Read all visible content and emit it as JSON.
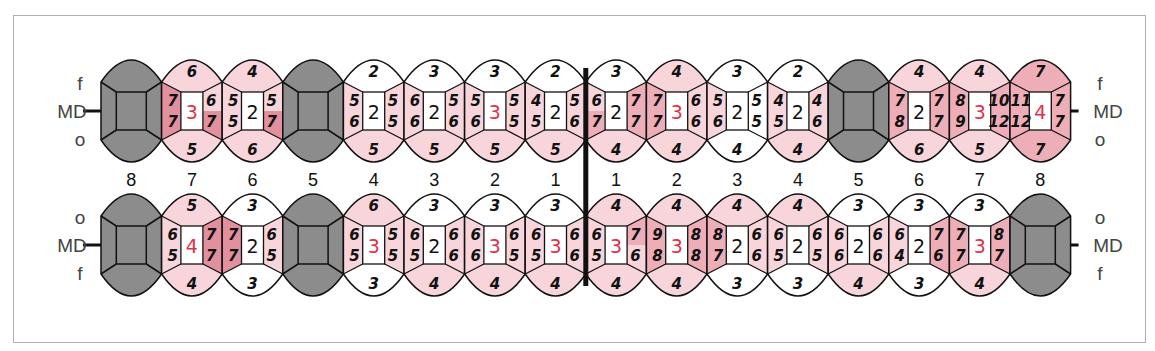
{
  "chart": {
    "row_labels": {
      "upper": {
        "top": "f",
        "middle": "MD",
        "bottom": "o"
      },
      "lower": {
        "top": "o",
        "middle": "MD",
        "bottom": "f"
      }
    },
    "tooth_numbers": [
      "8",
      "7",
      "6",
      "5",
      "4",
      "3",
      "2",
      "1",
      "1",
      "2",
      "3",
      "4",
      "5",
      "6",
      "7",
      "8"
    ],
    "colors": {
      "missing": "#8c8c8c",
      "light": "#f7d5da",
      "medium": "#eeaeb8",
      "dark": "#e3909e",
      "white": "#ffffff",
      "red_text": "#e0304a"
    },
    "upper": [
      {
        "num": "8",
        "missing": true
      },
      {
        "num": "7",
        "top": "6",
        "bottom": "5",
        "lt": "7",
        "lb": "7",
        "rt": "6",
        "rb": "7",
        "center": "3",
        "red": true,
        "c": {
          "top": "light",
          "bottom": "light",
          "lt": "dark",
          "lb": "dark",
          "rt": "light",
          "rb": "dark"
        }
      },
      {
        "num": "6",
        "top": "4",
        "bottom": "6",
        "lt": "5",
        "lb": "5",
        "rt": "5",
        "rb": "7",
        "center": "2",
        "red": false,
        "c": {
          "top": "light",
          "bottom": "light",
          "lt": "light",
          "lb": "light",
          "rt": "light",
          "rb": "dark"
        }
      },
      {
        "num": "5",
        "missing": true
      },
      {
        "num": "4",
        "top": "2",
        "bottom": "5",
        "lt": "5",
        "lb": "6",
        "rt": "5",
        "rb": "5",
        "center": "2",
        "red": false,
        "c": {
          "top": "white",
          "bottom": "light",
          "lt": "light",
          "lb": "light",
          "rt": "light",
          "rb": "light"
        }
      },
      {
        "num": "3",
        "top": "3",
        "bottom": "5",
        "lt": "6",
        "lb": "6",
        "rt": "5",
        "rb": "6",
        "center": "2",
        "red": false,
        "c": {
          "top": "white",
          "bottom": "light",
          "lt": "light",
          "lb": "light",
          "rt": "light",
          "rb": "light"
        }
      },
      {
        "num": "2",
        "top": "3",
        "bottom": "5",
        "lt": "5",
        "lb": "6",
        "rt": "5",
        "rb": "5",
        "center": "3",
        "red": true,
        "c": {
          "top": "white",
          "bottom": "light",
          "lt": "light",
          "lb": "light",
          "rt": "light",
          "rb": "light"
        }
      },
      {
        "num": "1",
        "top": "2",
        "bottom": "5",
        "lt": "4",
        "lb": "5",
        "rt": "5",
        "rb": "6",
        "center": "2",
        "red": false,
        "c": {
          "top": "white",
          "bottom": "light",
          "lt": "light",
          "lb": "light",
          "rt": "light",
          "rb": "light"
        }
      },
      {
        "num": "1",
        "top": "3",
        "bottom": "4",
        "lt": "6",
        "lb": "7",
        "rt": "7",
        "rb": "7",
        "center": "2",
        "red": false,
        "c": {
          "top": "white",
          "bottom": "light",
          "lt": "light",
          "lb": "medium",
          "rt": "medium",
          "rb": "medium"
        }
      },
      {
        "num": "2",
        "top": "4",
        "bottom": "4",
        "lt": "7",
        "lb": "7",
        "rt": "6",
        "rb": "6",
        "center": "3",
        "red": true,
        "c": {
          "top": "light",
          "bottom": "light",
          "lt": "medium",
          "lb": "medium",
          "rt": "light",
          "rb": "light"
        }
      },
      {
        "num": "3",
        "top": "3",
        "bottom": "4",
        "lt": "5",
        "lb": "6",
        "rt": "5",
        "rb": "5",
        "center": "2",
        "red": false,
        "c": {
          "top": "white",
          "bottom": "white",
          "lt": "light",
          "lb": "light",
          "rt": "white",
          "rb": "white"
        }
      },
      {
        "num": "4",
        "top": "2",
        "bottom": "4",
        "lt": "4",
        "lb": "5",
        "rt": "4",
        "rb": "6",
        "center": "2",
        "red": false,
        "c": {
          "top": "white",
          "bottom": "light",
          "lt": "light",
          "lb": "light",
          "rt": "light",
          "rb": "light"
        }
      },
      {
        "num": "5",
        "missing": true
      },
      {
        "num": "6",
        "top": "4",
        "bottom": "6",
        "lt": "7",
        "lb": "8",
        "rt": "7",
        "rb": "7",
        "center": "2",
        "red": false,
        "c": {
          "top": "light",
          "bottom": "light",
          "lt": "medium",
          "lb": "medium",
          "rt": "medium",
          "rb": "medium"
        }
      },
      {
        "num": "7",
        "top": "4",
        "bottom": "5",
        "lt": "8",
        "lb": "9",
        "rt": "10",
        "rb": "12",
        "center": "3",
        "red": true,
        "c": {
          "top": "light",
          "bottom": "light",
          "lt": "medium",
          "lb": "medium",
          "rt": "medium",
          "rb": "medium"
        }
      },
      {
        "num": "8",
        "top": "7",
        "bottom": "7",
        "lt": "11",
        "lb": "12",
        "rt": "7",
        "rb": "7",
        "center": "4",
        "red": true,
        "c": {
          "top": "medium",
          "bottom": "medium",
          "lt": "medium",
          "lb": "medium",
          "rt": "medium",
          "rb": "medium"
        }
      }
    ],
    "lower": [
      {
        "num": "8",
        "missing": true
      },
      {
        "num": "7",
        "top": "5",
        "bottom": "4",
        "lt": "6",
        "lb": "5",
        "rt": "7",
        "rb": "7",
        "center": "4",
        "red": true,
        "c": {
          "top": "light",
          "bottom": "light",
          "lt": "light",
          "lb": "light",
          "rt": "dark",
          "rb": "dark"
        }
      },
      {
        "num": "6",
        "top": "3",
        "bottom": "3",
        "lt": "7",
        "lb": "7",
        "rt": "6",
        "rb": "5",
        "center": "2",
        "red": false,
        "c": {
          "top": "white",
          "bottom": "white",
          "lt": "dark",
          "lb": "dark",
          "rt": "light",
          "rb": "light"
        }
      },
      {
        "num": "5",
        "missing": true
      },
      {
        "num": "4",
        "top": "6",
        "bottom": "3",
        "lt": "6",
        "lb": "5",
        "rt": "5",
        "rb": "5",
        "center": "3",
        "red": true,
        "c": {
          "top": "light",
          "bottom": "white",
          "lt": "light",
          "lb": "light",
          "rt": "light",
          "rb": "light"
        }
      },
      {
        "num": "3",
        "top": "3",
        "bottom": "4",
        "lt": "6",
        "lb": "5",
        "rt": "6",
        "rb": "6",
        "center": "2",
        "red": false,
        "c": {
          "top": "white",
          "bottom": "light",
          "lt": "light",
          "lb": "light",
          "rt": "light",
          "rb": "light"
        }
      },
      {
        "num": "2",
        "top": "3",
        "bottom": "4",
        "lt": "6",
        "lb": "6",
        "rt": "6",
        "rb": "5",
        "center": "3",
        "red": true,
        "c": {
          "top": "white",
          "bottom": "light",
          "lt": "light",
          "lb": "light",
          "rt": "light",
          "rb": "light"
        }
      },
      {
        "num": "1",
        "top": "3",
        "bottom": "4",
        "lt": "6",
        "lb": "5",
        "rt": "6",
        "rb": "6",
        "center": "3",
        "red": true,
        "c": {
          "top": "white",
          "bottom": "light",
          "lt": "light",
          "lb": "light",
          "rt": "light",
          "rb": "light"
        }
      },
      {
        "num": "1",
        "top": "4",
        "bottom": "4",
        "lt": "6",
        "lb": "5",
        "rt": "7",
        "rb": "6",
        "center": "3",
        "red": true,
        "c": {
          "top": "light",
          "bottom": "light",
          "lt": "light",
          "lb": "light",
          "rt": "medium",
          "rb": "light"
        }
      },
      {
        "num": "2",
        "top": "4",
        "bottom": "4",
        "lt": "9",
        "lb": "8",
        "rt": "8",
        "rb": "8",
        "center": "3",
        "red": true,
        "c": {
          "top": "light",
          "bottom": "light",
          "lt": "medium",
          "lb": "medium",
          "rt": "medium",
          "rb": "medium"
        }
      },
      {
        "num": "3",
        "top": "4",
        "bottom": "3",
        "lt": "8",
        "lb": "7",
        "rt": "6",
        "rb": "6",
        "center": "2",
        "red": false,
        "c": {
          "top": "light",
          "bottom": "white",
          "lt": "medium",
          "lb": "medium",
          "rt": "light",
          "rb": "light"
        }
      },
      {
        "num": "4",
        "top": "4",
        "bottom": "3",
        "lt": "6",
        "lb": "5",
        "rt": "6",
        "rb": "5",
        "center": "2",
        "red": false,
        "c": {
          "top": "light",
          "bottom": "white",
          "lt": "light",
          "lb": "light",
          "rt": "light",
          "rb": "light"
        }
      },
      {
        "num": "5",
        "top": "3",
        "bottom": "4",
        "lt": "6",
        "lb": "6",
        "rt": "6",
        "rb": "6",
        "center": "2",
        "red": false,
        "c": {
          "top": "white",
          "bottom": "light",
          "lt": "light",
          "lb": "light",
          "rt": "light",
          "rb": "light"
        }
      },
      {
        "num": "6",
        "top": "3",
        "bottom": "3",
        "lt": "6",
        "lb": "4",
        "rt": "7",
        "rb": "6",
        "center": "2",
        "red": false,
        "c": {
          "top": "white",
          "bottom": "white",
          "lt": "light",
          "lb": "light",
          "rt": "medium",
          "rb": "medium"
        }
      },
      {
        "num": "7",
        "top": "3",
        "bottom": "4",
        "lt": "7",
        "lb": "7",
        "rt": "8",
        "rb": "7",
        "center": "3",
        "red": true,
        "c": {
          "top": "white",
          "bottom": "light",
          "lt": "medium",
          "lb": "medium",
          "rt": "medium",
          "rb": "medium"
        }
      },
      {
        "num": "8",
        "missing": true
      }
    ]
  }
}
